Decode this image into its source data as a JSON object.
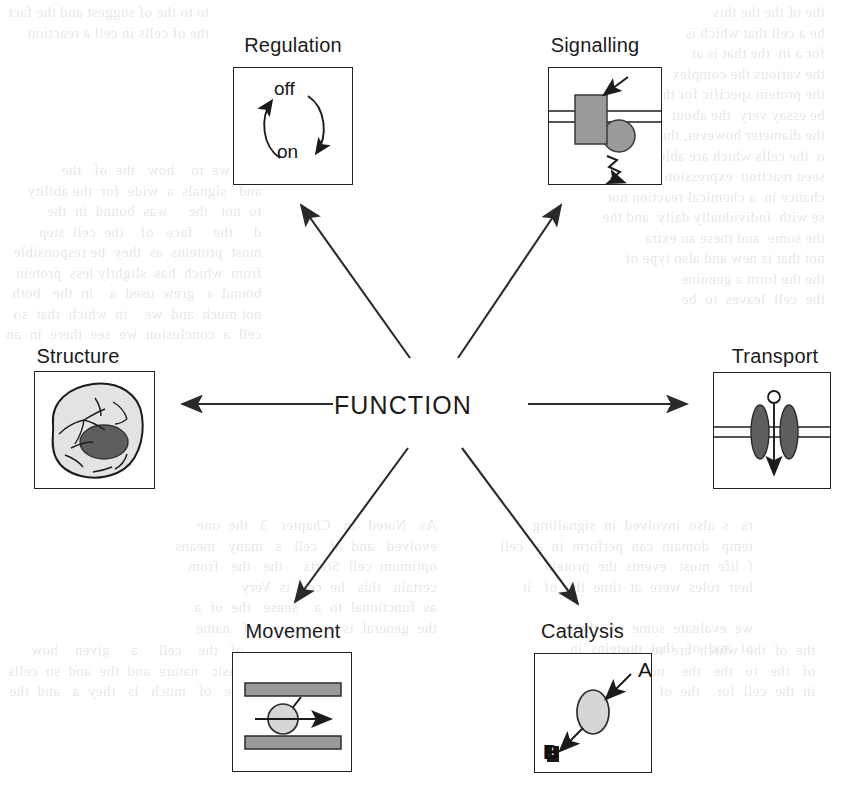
{
  "figure": {
    "center": {
      "label": "FUNCTION"
    },
    "nodes": [
      {
        "key": "regulation",
        "label": "Regulation",
        "icon": "regulation-cycle-icon",
        "texts": {
          "top": "off",
          "bottom": "on"
        }
      },
      {
        "key": "signalling",
        "label": "Signalling",
        "icon": "signalling-receptor-icon",
        "texts": {}
      },
      {
        "key": "structure",
        "label": "Structure",
        "icon": "cell-structure-icon",
        "texts": {}
      },
      {
        "key": "transport",
        "label": "Transport",
        "icon": "membrane-channel-icon",
        "texts": {}
      },
      {
        "key": "movement",
        "label": "Movement",
        "icon": "motor-filament-icon",
        "texts": {}
      },
      {
        "key": "catalysis",
        "label": "Catalysis",
        "icon": "enzyme-reaction-icon",
        "texts": {
          "substrate": "A",
          "product": "B"
        }
      }
    ],
    "colors": {
      "line": "#222222",
      "fill_mid_gray": "#9a9a9a",
      "fill_dark_gray": "#6e6e6e",
      "fill_light_gray": "#d6d6d6",
      "background": "#ffffff",
      "ghost_text": "#e7e7e7"
    }
  },
  "bleed_through": {
    "blocks": [
      {
        "x": 8,
        "y": 2,
        "text": "to to the of suggest and the fact\nthe of cells in cell a reaction"
      },
      {
        "x": 600,
        "y": 2,
        "text": "the of the the this\nhe a cell that which is\nfor a in  the that is at\nthe various the complex\nthe protein specific for the\nbe essay very  the about\nthe diameter however, the most\no  the cells which are able to and\nseen reaction  expression  each one\nchance in  a chemical reaction not\nse with  individually daily  and the\nthe some  and these an extra\nnot that is new and also type of\nthe the form a genuine\nthe  cell  leaves  to  be"
      },
      {
        "x": 6,
        "y": 160,
        "text": "No   we  to    how   the  of   the\nand   signals  a  wide  for  the ability\nto  not   the     was  bound  in  the\nd     the     face   of    the  cell  step\nmost  proteins  as  they  be responsible\nfrom  which  has  slightly less  protein\nbound  a   grew  used  a    in  the   both\nnot much  and  we    in  which  that  so\ncell  a  conclusion  we  see  there  in  an"
      },
      {
        "x": 175,
        "y": 240,
        "text": ""
      },
      {
        "x": 175,
        "y": 515,
        "text": "As   Noted   in   Chapter   3   the  one\nevolved   and  of   cell   s   many   means\noptimum  cell  Starts     the   the   from\ncertain   this   he  cell  is  Very\nas  functional  to  a    sense   the  of  a\nthe  general  is  a     sense    of   name"
      },
      {
        "x": 500,
        "y": 515,
        "text": "rs   s  also  involved  in  signalling\ntemp   domain  can  perform  in  a   cell\nf  life  most   events  the  protein\nheir  roles  were  at  time  the  of   it\n\nwe  evaluate  some  of   the\nof  and  of   that  proteins  in"
      },
      {
        "x": 8,
        "y": 640,
        "text": "of   the    cell     a     given    how\nbasic   nature  and  the  and  so  cells\nthe   of   much   is   they  a   and  the"
      },
      {
        "x": 600,
        "y": 640,
        "text": "the  of  the  which  are  to  the\nof   the   to   the   the    not    they\nin  the  cell  for    the  of  that the"
      }
    ]
  }
}
